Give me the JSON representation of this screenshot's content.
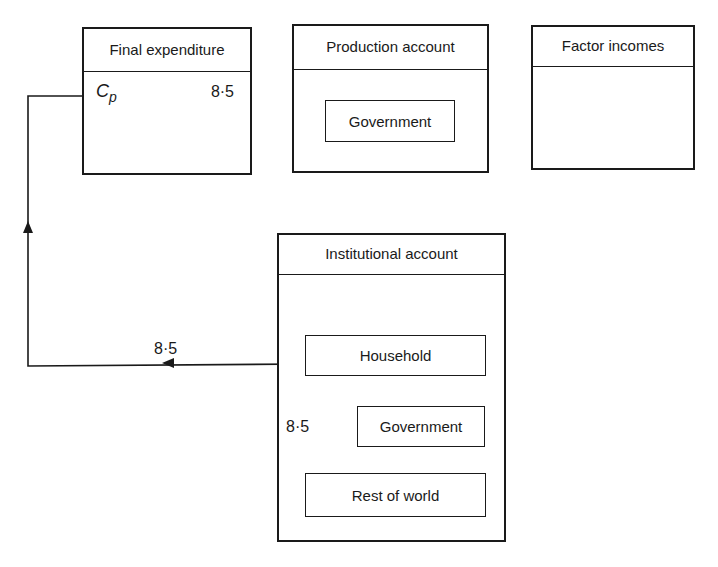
{
  "accounts": {
    "final_expenditure": {
      "title": "Final expenditure",
      "entry_symbol": "C",
      "entry_subscript": "p",
      "entry_value": "8·5"
    },
    "production": {
      "title": "Production account",
      "sectors": [
        "Government"
      ]
    },
    "factor_incomes": {
      "title": "Factor incomes"
    },
    "institutional": {
      "title": "Institutional account",
      "sectors": [
        "Household",
        "Government",
        "Rest of world"
      ]
    }
  },
  "flows": [
    {
      "from": "Rest of world",
      "to": "Household",
      "value": "8·5"
    },
    {
      "from": "Household",
      "to": "Final expenditure (Cp)",
      "value": "8·5"
    }
  ],
  "colors": {
    "ink": "#1a1a1a",
    "paper": "#ffffff"
  }
}
